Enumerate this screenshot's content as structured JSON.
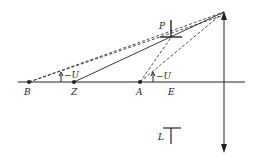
{
  "diagram": {
    "type": "optics-ray-diagram",
    "colors": {
      "stroke": "#222222",
      "background": "#ffffff"
    },
    "axis": {
      "x1": 18,
      "x2": 245,
      "y": 82
    },
    "lens": {
      "x": 224,
      "top_y": 12,
      "bottom_y": 152,
      "top_arrow": "up",
      "bottom_arrow": "down"
    },
    "apex": {
      "x": 224,
      "y": 12
    },
    "points": [
      {
        "id": "B",
        "label": "B",
        "x": 29,
        "y": 82,
        "label_x": 24,
        "label_y": 94
      },
      {
        "id": "Z",
        "label": "Z",
        "x": 74,
        "y": 82,
        "label_x": 71,
        "label_y": 94
      },
      {
        "id": "A",
        "label": "A",
        "x": 140,
        "y": 82,
        "label_x": 136,
        "label_y": 94
      },
      {
        "id": "E",
        "label": "E",
        "x": 170,
        "y": 82,
        "label_x": 168,
        "label_y": 94,
        "marker": false
      }
    ],
    "markers": [
      {
        "id": "P",
        "label": "P",
        "label_x": 159,
        "label_y": 29
      },
      {
        "id": "L",
        "label": "L",
        "label_x": 158,
        "label_y": 139
      }
    ],
    "angle_labels": [
      {
        "id": "angle-U-left",
        "label": "U",
        "sign": "−U",
        "x": 66,
        "y": 77
      },
      {
        "id": "angle-U-right",
        "label": "U",
        "sign": "−U",
        "x": 158,
        "y": 78
      }
    ]
  }
}
